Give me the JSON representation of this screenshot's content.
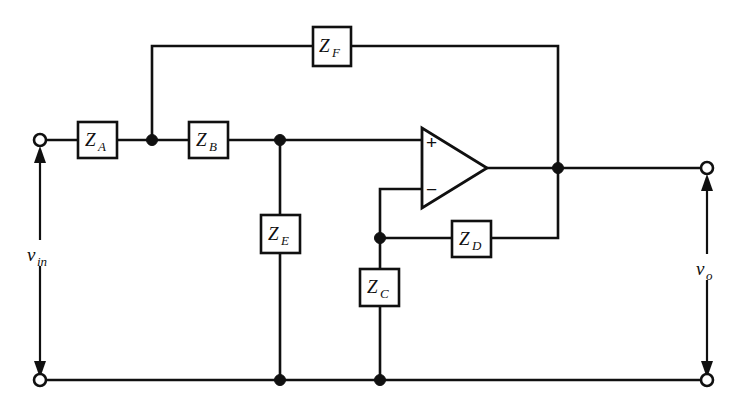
{
  "figure": {
    "type": "circuit-schematic",
    "background_color": "#ffffff",
    "line_color": "#101010",
    "width": 743,
    "height": 408
  },
  "components": {
    "impedances": [
      {
        "id": "ZA",
        "symbol": "Z",
        "subscript": "A",
        "label": "Z_A",
        "x": 78,
        "y": 122,
        "w": 39,
        "h": 36,
        "orientation": "horizontal"
      },
      {
        "id": "ZB",
        "symbol": "Z",
        "subscript": "B",
        "label": "Z_B",
        "x": 189,
        "y": 122,
        "w": 39,
        "h": 36,
        "orientation": "horizontal"
      },
      {
        "id": "ZC",
        "symbol": "Z",
        "subscript": "C",
        "label": "Z_C",
        "x": 360,
        "y": 269,
        "w": 39,
        "h": 37,
        "orientation": "vertical"
      },
      {
        "id": "ZD",
        "symbol": "Z",
        "subscript": "D",
        "label": "Z_D",
        "x": 452,
        "y": 221,
        "w": 39,
        "h": 36,
        "orientation": "horizontal"
      },
      {
        "id": "ZE",
        "symbol": "Z",
        "subscript": "E",
        "label": "Z_E",
        "x": 261,
        "y": 215,
        "w": 39,
        "h": 38,
        "orientation": "vertical"
      },
      {
        "id": "ZF",
        "symbol": "Z",
        "subscript": "F",
        "label": "Z_F",
        "x": 313,
        "y": 27,
        "w": 38,
        "h": 39,
        "orientation": "horizontal"
      }
    ],
    "opamp": {
      "id": "opamp-1",
      "apex_x": 487,
      "apex_y": 168,
      "left_x": 422,
      "top_y": 128,
      "bottom_y": 208,
      "noninverting_sign": "+",
      "inverting_sign": "−",
      "noninverting_y": 142,
      "inverting_y": 189
    },
    "terminals": [
      {
        "id": "in-top",
        "label": "v_in",
        "x": 40,
        "y": 140,
        "radius": 6
      },
      {
        "id": "in-bottom",
        "label": "",
        "x": 40,
        "y": 380,
        "radius": 6
      },
      {
        "id": "out-top",
        "label": "v_o",
        "x": 707,
        "y": 168,
        "radius": 6
      },
      {
        "id": "out-bottom",
        "label": "",
        "x": 707,
        "y": 380,
        "radius": 6
      }
    ],
    "junction_dots": [
      {
        "id": "node-za-zb",
        "x": 152,
        "y": 140
      },
      {
        "id": "node-zb-ze",
        "x": 280,
        "y": 140
      },
      {
        "id": "node-zc-zd",
        "x": 380,
        "y": 238
      },
      {
        "id": "node-output",
        "x": 558,
        "y": 168
      },
      {
        "id": "node-ze-ground",
        "x": 280,
        "y": 380
      },
      {
        "id": "node-zc-ground",
        "x": 380,
        "y": 380
      }
    ]
  },
  "labels": {
    "input_voltage": {
      "symbol": "v",
      "subscript": "in",
      "text": "v_in",
      "x": 40,
      "y": 258
    },
    "output_voltage": {
      "symbol": "v",
      "subscript": "o",
      "text": "v_o",
      "x": 707,
      "y": 272
    },
    "za": {
      "symbol": "Z",
      "subscript": "A"
    },
    "zb": {
      "symbol": "Z",
      "subscript": "B"
    },
    "zc": {
      "symbol": "Z",
      "subscript": "C"
    },
    "zd": {
      "symbol": "Z",
      "subscript": "D"
    },
    "ze": {
      "symbol": "Z",
      "subscript": "E"
    },
    "zf": {
      "symbol": "Z",
      "subscript": "F"
    },
    "plus_sign": "+",
    "minus_sign": "−"
  },
  "nets": [
    {
      "id": "input-rail",
      "description": "input terminal to Z_A to node to Z_B to node to opamp + input"
    },
    {
      "id": "feedback-top",
      "description": "Z_A/Z_B node up through Z_F to output node"
    },
    {
      "id": "ze-branch",
      "description": "Z_B output node down through Z_E to ground rail"
    },
    {
      "id": "zc-branch",
      "description": "opamp - input down through Z_C to ground rail"
    },
    {
      "id": "zd-feedback",
      "description": "opamp - input node through Z_D to output node"
    },
    {
      "id": "output-rail",
      "description": "opamp output node to output terminal"
    },
    {
      "id": "ground-rail",
      "description": "bottom rail connecting input bottom terminal to output bottom terminal"
    }
  ]
}
